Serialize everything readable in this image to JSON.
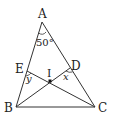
{
  "diagram": {
    "type": "geometry-triangle",
    "points": {
      "A": {
        "label": "A",
        "x": 42,
        "y": 22
      },
      "B": {
        "label": "B",
        "x": 16,
        "y": 107
      },
      "C": {
        "label": "C",
        "x": 95,
        "y": 107
      },
      "D": {
        "label": "D",
        "x": 70,
        "y": 68
      },
      "E": {
        "label": "E",
        "x": 27,
        "y": 71
      },
      "I": {
        "label": "I",
        "x": 50,
        "y": 81
      }
    },
    "segments": [
      "AB",
      "AC",
      "BC",
      "BD",
      "CE"
    ],
    "angles": {
      "A": {
        "label": "50°"
      },
      "D": {
        "label": "x"
      },
      "E": {
        "label": "y"
      }
    }
  }
}
